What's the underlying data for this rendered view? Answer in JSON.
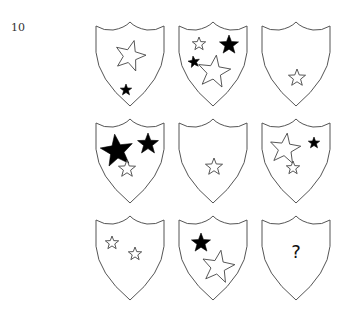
{
  "question": {
    "number": "10",
    "missing_symbol": "?"
  },
  "grid": {
    "rows": 3,
    "cols": 3,
    "shield_size": {
      "w": 68,
      "h": 84
    },
    "col_x": [
      96,
      179,
      262
    ],
    "row_y": [
      22,
      119,
      216
    ]
  },
  "shields": [
    {
      "row": 0,
      "col": 0,
      "stars": [
        {
          "cx": 34,
          "cy": 34,
          "r": 16,
          "filled": false,
          "rot": 15
        },
        {
          "cx": 30,
          "cy": 68,
          "r": 6,
          "filled": true,
          "rot": 0
        }
      ]
    },
    {
      "row": 0,
      "col": 1,
      "stars": [
        {
          "cx": 20,
          "cy": 22,
          "r": 7,
          "filled": false,
          "rot": 0
        },
        {
          "cx": 50,
          "cy": 23,
          "r": 10,
          "filled": true,
          "rot": 0
        },
        {
          "cx": 15,
          "cy": 40,
          "r": 6,
          "filled": true,
          "rot": -10
        },
        {
          "cx": 35,
          "cy": 50,
          "r": 17,
          "filled": false,
          "rot": 8
        }
      ]
    },
    {
      "row": 0,
      "col": 2,
      "stars": [
        {
          "cx": 35,
          "cy": 56,
          "r": 9,
          "filled": false,
          "rot": 0
        }
      ]
    },
    {
      "row": 1,
      "col": 0,
      "stars": [
        {
          "cx": 21,
          "cy": 32,
          "r": 17,
          "filled": true,
          "rot": -8
        },
        {
          "cx": 52,
          "cy": 25,
          "r": 11,
          "filled": true,
          "rot": 0
        },
        {
          "cx": 31,
          "cy": 50,
          "r": 9,
          "filled": false,
          "rot": 0
        }
      ]
    },
    {
      "row": 1,
      "col": 1,
      "stars": [
        {
          "cx": 35,
          "cy": 48,
          "r": 9,
          "filled": false,
          "rot": 0
        }
      ]
    },
    {
      "row": 1,
      "col": 2,
      "stars": [
        {
          "cx": 23,
          "cy": 30,
          "r": 16,
          "filled": false,
          "rot": 8
        },
        {
          "cx": 52,
          "cy": 24,
          "r": 6,
          "filled": true,
          "rot": 0
        },
        {
          "cx": 31,
          "cy": 49,
          "r": 7,
          "filled": false,
          "rot": 0
        }
      ]
    },
    {
      "row": 2,
      "col": 0,
      "stars": [
        {
          "cx": 16,
          "cy": 27,
          "r": 7,
          "filled": false,
          "rot": 0
        },
        {
          "cx": 39,
          "cy": 38,
          "r": 7,
          "filled": false,
          "rot": 0
        }
      ]
    },
    {
      "row": 2,
      "col": 1,
      "stars": [
        {
          "cx": 22,
          "cy": 27,
          "r": 10,
          "filled": true,
          "rot": 0
        },
        {
          "cx": 39,
          "cy": 51,
          "r": 17,
          "filled": false,
          "rot": 10
        }
      ]
    },
    {
      "row": 2,
      "col": 2,
      "stars": [],
      "label": "?"
    }
  ]
}
